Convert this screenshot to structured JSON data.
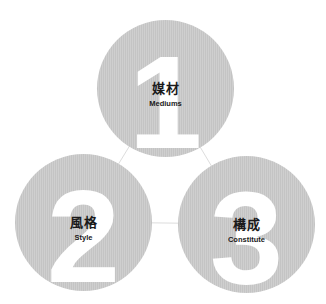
{
  "diagram": {
    "type": "three-circle concept diagram",
    "colors": {
      "circle": "#c9c9c9",
      "numeral": "#ffffff",
      "text": "#1a1a1a",
      "connector": "#dddddd"
    },
    "items": [
      {
        "number": "1",
        "title_zh": "媒材",
        "title_en": "Mediums"
      },
      {
        "number": "2",
        "title_zh": "風格",
        "title_en": "Style"
      },
      {
        "number": "3",
        "title_zh": "構成",
        "title_en": "Constitute"
      }
    ]
  }
}
